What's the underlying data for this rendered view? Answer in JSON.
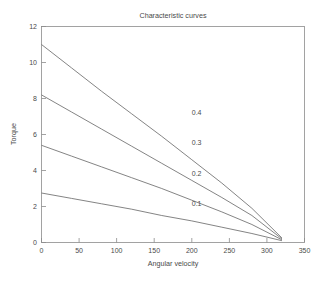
{
  "chart_data": {
    "type": "line",
    "title": "Characteristic curves",
    "xlabel": "Angular velocity",
    "ylabel": "Torque",
    "xlim": [
      0,
      350
    ],
    "ylim": [
      0,
      12
    ],
    "xticks": [
      0,
      50,
      100,
      150,
      200,
      250,
      300,
      350
    ],
    "yticks": [
      0,
      2,
      4,
      6,
      8,
      10,
      12
    ],
    "grid": false,
    "legend": "none (inline curve annotations)",
    "series": [
      {
        "name": "0.4",
        "label": "0.4",
        "x": [
          0,
          40,
          80,
          120,
          160,
          200,
          240,
          280,
          320
        ],
        "values": [
          11.0,
          9.7,
          8.4,
          7.15,
          5.9,
          4.6,
          3.3,
          1.9,
          0.25
        ]
      },
      {
        "name": "0.3",
        "label": "0.3",
        "x": [
          0,
          40,
          80,
          120,
          160,
          200,
          240,
          280,
          320
        ],
        "values": [
          8.2,
          7.25,
          6.3,
          5.35,
          4.4,
          3.45,
          2.5,
          1.5,
          0.2
        ]
      },
      {
        "name": "0.2",
        "label": "0.2",
        "x": [
          0,
          40,
          80,
          120,
          160,
          200,
          240,
          280,
          320
        ],
        "values": [
          5.4,
          4.8,
          4.2,
          3.6,
          3.0,
          2.35,
          1.7,
          1.0,
          0.15
        ]
      },
      {
        "name": "0.1",
        "label": "0.1",
        "x": [
          0,
          40,
          80,
          120,
          160,
          200,
          240,
          280,
          320
        ],
        "values": [
          2.75,
          2.45,
          2.15,
          1.85,
          1.5,
          1.2,
          0.85,
          0.5,
          0.1
        ]
      }
    ],
    "annotations": [
      {
        "text": "0.4",
        "x": 200,
        "y": 7.1
      },
      {
        "text": "0.3",
        "x": 200,
        "y": 5.4
      },
      {
        "text": "0.2",
        "x": 200,
        "y": 3.7
      },
      {
        "text": "0.1",
        "x": 200,
        "y": 2.05
      }
    ]
  },
  "axis_tick_labels": {
    "x": [
      "0",
      "50",
      "100",
      "150",
      "200",
      "250",
      "300",
      "350"
    ],
    "y": [
      "0",
      "2",
      "4",
      "6",
      "8",
      "10",
      "12"
    ]
  },
  "colors": {
    "background": "#ffffff",
    "axis": "#8c8c8c",
    "curve": "#6e6e6e",
    "text": "#4a4a4a"
  }
}
